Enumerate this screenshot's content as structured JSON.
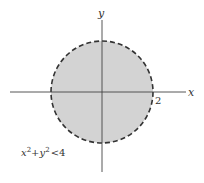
{
  "diagram": {
    "axes": {
      "x_label": "x",
      "y_label": "y"
    },
    "tick_label": "2",
    "region": {
      "inequality_lhs_x": "x",
      "exp1": "2",
      "plus": "+",
      "inequality_lhs_y": "y",
      "exp2": "2",
      "relation": "<",
      "rhs": "4",
      "boundary": "dashed",
      "fill_color": "#d3d3d3",
      "stroke_color": "#333333"
    }
  }
}
